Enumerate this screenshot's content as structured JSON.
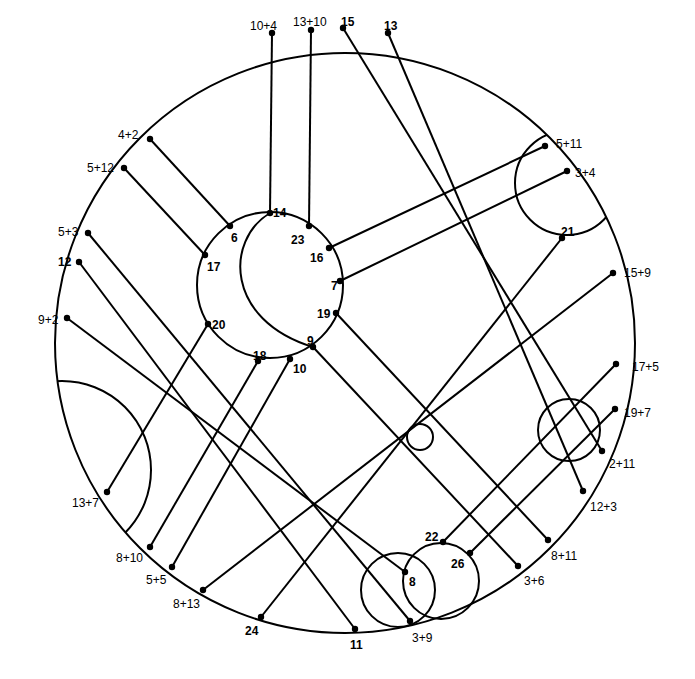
{
  "diagram": {
    "colors": {
      "stroke": "#000000",
      "background": "#ffffff"
    },
    "outer_circle": {
      "cx": 345,
      "cy": 343,
      "r": 290
    },
    "inner_circle": {
      "cx": 270,
      "cy": 285,
      "r": 73
    },
    "crescent_arc": {
      "d": "M 270 213 C 225 240, 225 320, 313 347"
    },
    "circles": [
      {
        "name": "small-center-circle",
        "cx": 420,
        "cy": 437,
        "r": 13
      },
      {
        "name": "lower-right-circle",
        "cx": 569,
        "cy": 430,
        "r": 31
      },
      {
        "name": "bottom-circle-left",
        "cx": 398,
        "cy": 590,
        "r": 37
      },
      {
        "name": "bottom-circle-right",
        "cx": 441,
        "cy": 581,
        "r": 38
      }
    ],
    "clipped_arcs": [
      {
        "name": "upper-right-arc",
        "cx": 567,
        "cy": 183,
        "r": 52
      },
      {
        "name": "left-arc",
        "cx": 62,
        "cy": 470,
        "r": 89
      }
    ],
    "points": [
      {
        "id": "p-10+4",
        "label": "10+4",
        "x": 272,
        "y": 33,
        "lx": 250,
        "ly": 26,
        "bold": false
      },
      {
        "id": "p-13+10",
        "label": "13+10",
        "x": 311,
        "y": 30,
        "lx": 293,
        "ly": 22,
        "bold": false
      },
      {
        "id": "p-15",
        "label": "15",
        "x": 343,
        "y": 28,
        "lx": 341,
        "ly": 22,
        "bold": true
      },
      {
        "id": "p-13",
        "label": "13",
        "x": 388,
        "y": 33,
        "lx": 384,
        "ly": 26,
        "bold": true
      },
      {
        "id": "p-4+2",
        "label": "4+2",
        "x": 150,
        "y": 139,
        "lx": 118,
        "ly": 135,
        "bold": false
      },
      {
        "id": "p-5+12",
        "label": "5+12",
        "x": 124,
        "y": 168,
        "lx": 87,
        "ly": 168,
        "bold": false
      },
      {
        "id": "p-5+3",
        "label": "5+3",
        "x": 88,
        "y": 233,
        "lx": 58,
        "ly": 232,
        "bold": false
      },
      {
        "id": "p-12",
        "label": "12",
        "x": 79,
        "y": 262,
        "lx": 58,
        "ly": 262,
        "bold": true
      },
      {
        "id": "p-9+2",
        "label": "9+2",
        "x": 67,
        "y": 318,
        "lx": 38,
        "ly": 320,
        "bold": false
      },
      {
        "id": "p-13+7",
        "label": "13+7",
        "x": 107,
        "y": 492,
        "lx": 72,
        "ly": 503,
        "bold": false
      },
      {
        "id": "p-8+10",
        "label": "8+10",
        "x": 150,
        "y": 547,
        "lx": 116,
        "ly": 558,
        "bold": false
      },
      {
        "id": "p-5+5",
        "label": "5+5",
        "x": 172,
        "y": 567,
        "lx": 146,
        "ly": 580,
        "bold": false
      },
      {
        "id": "p-8+13",
        "label": "8+13",
        "x": 203,
        "y": 590,
        "lx": 173,
        "ly": 604,
        "bold": false
      },
      {
        "id": "p-24",
        "label": "24",
        "x": 261,
        "y": 617,
        "lx": 245,
        "ly": 631,
        "bold": true
      },
      {
        "id": "p-11",
        "label": "11",
        "x": 355,
        "y": 629,
        "lx": 350,
        "ly": 645,
        "bold": true
      },
      {
        "id": "p-3+9",
        "label": "3+9",
        "x": 410,
        "y": 621,
        "lx": 412,
        "ly": 638,
        "bold": false
      },
      {
        "id": "p-3+6",
        "label": "3+6",
        "x": 518,
        "y": 566,
        "lx": 524,
        "ly": 581,
        "bold": false
      },
      {
        "id": "p-8+11",
        "label": "8+11",
        "x": 548,
        "y": 540,
        "lx": 551,
        "ly": 556,
        "bold": false
      },
      {
        "id": "p-12+3",
        "label": "12+3",
        "x": 583,
        "y": 491,
        "lx": 590,
        "ly": 507,
        "bold": false
      },
      {
        "id": "p-2+11",
        "label": "2+11",
        "x": 602,
        "y": 451,
        "lx": 609,
        "ly": 464,
        "bold": false
      },
      {
        "id": "p-19+7",
        "label": "19+7",
        "x": 615,
        "y": 409,
        "lx": 624,
        "ly": 413,
        "bold": false
      },
      {
        "id": "p-17+5",
        "label": "17+5",
        "x": 616,
        "y": 364,
        "lx": 632,
        "ly": 367,
        "bold": false
      },
      {
        "id": "p-15+9",
        "label": "15+9",
        "x": 613,
        "y": 273,
        "lx": 624,
        "ly": 273,
        "bold": false
      },
      {
        "id": "p-3+4",
        "label": "3+4",
        "x": 567,
        "y": 171,
        "lx": 575,
        "ly": 173,
        "bold": false
      },
      {
        "id": "p-5+11",
        "label": "5+11",
        "x": 545,
        "y": 146,
        "lx": 556,
        "ly": 144,
        "bold": false
      },
      {
        "id": "p-21",
        "label": "21",
        "x": 562,
        "y": 238,
        "lx": 561,
        "ly": 232,
        "bold": true
      },
      {
        "id": "p-22",
        "label": "22",
        "x": 443,
        "y": 542,
        "lx": 425,
        "ly": 537,
        "bold": true
      },
      {
        "id": "p-26",
        "label": "26",
        "x": 470,
        "y": 553,
        "lx": 451,
        "ly": 564,
        "bold": true
      },
      {
        "id": "p-8",
        "label": "8",
        "x": 405,
        "y": 572,
        "lx": 409,
        "ly": 582,
        "bold": true
      },
      {
        "id": "p-14",
        "label": "14",
        "x": 270,
        "y": 213,
        "lx": 273,
        "ly": 213,
        "bold": true
      },
      {
        "id": "p-23",
        "label": "23",
        "x": 309,
        "y": 226,
        "lx": 291,
        "ly": 240,
        "bold": true
      },
      {
        "id": "p-6",
        "label": "6",
        "x": 230,
        "y": 226,
        "lx": 231,
        "ly": 238,
        "bold": true
      },
      {
        "id": "p-17",
        "label": "17",
        "x": 205,
        "y": 255,
        "lx": 207,
        "ly": 267,
        "bold": true
      },
      {
        "id": "p-16",
        "label": "16",
        "x": 329,
        "y": 248,
        "lx": 310,
        "ly": 258,
        "bold": true
      },
      {
        "id": "p-7",
        "label": "7",
        "x": 340,
        "y": 281,
        "lx": 331,
        "ly": 286,
        "bold": true
      },
      {
        "id": "p-19",
        "label": "19",
        "x": 336,
        "y": 313,
        "lx": 317,
        "ly": 314,
        "bold": true
      },
      {
        "id": "p-20",
        "label": "20",
        "x": 208,
        "y": 324,
        "lx": 212,
        "ly": 325,
        "bold": true
      },
      {
        "id": "p-9",
        "label": "9",
        "x": 313,
        "y": 347,
        "lx": 307,
        "ly": 341,
        "bold": true
      },
      {
        "id": "p-18",
        "label": "18",
        "x": 258,
        "y": 361,
        "lx": 253,
        "ly": 356,
        "bold": true
      },
      {
        "id": "p-10",
        "label": "10",
        "x": 290,
        "y": 359,
        "lx": 293,
        "ly": 369,
        "bold": true
      }
    ],
    "lines": [
      {
        "from": "p-10+4",
        "to": "p-14",
        "x1": 272,
        "y1": 33,
        "x2": 270,
        "y2": 213
      },
      {
        "from": "p-13+10",
        "to": "p-23",
        "x1": 311,
        "y1": 30,
        "x2": 309,
        "y2": 226
      },
      {
        "from": "p-15",
        "to": "p-2+11",
        "x1": 343,
        "y1": 28,
        "x2": 602,
        "y2": 451
      },
      {
        "from": "p-13",
        "to": "p-12+3",
        "x1": 388,
        "y1": 33,
        "x2": 583,
        "y2": 491
      },
      {
        "from": "p-4+2",
        "to": "p-6",
        "x1": 150,
        "y1": 139,
        "x2": 230,
        "y2": 226
      },
      {
        "from": "p-5+12",
        "to": "p-17",
        "x1": 124,
        "y1": 168,
        "x2": 205,
        "y2": 255
      },
      {
        "from": "p-5+3",
        "to": "p-3+9",
        "x1": 88,
        "y1": 233,
        "x2": 410,
        "y2": 621
      },
      {
        "from": "p-12",
        "to": "p-11",
        "x1": 79,
        "y1": 262,
        "x2": 355,
        "y2": 629
      },
      {
        "from": "p-9+2",
        "to": "p-8",
        "x1": 67,
        "y1": 318,
        "x2": 405,
        "y2": 572
      },
      {
        "from": "p-5+11",
        "to": "p-16",
        "x1": 545,
        "y1": 146,
        "x2": 329,
        "y2": 248
      },
      {
        "from": "p-3+4",
        "to": "p-7",
        "x1": 567,
        "y1": 171,
        "x2": 340,
        "y2": 281
      },
      {
        "from": "p-21",
        "to": "p-24",
        "x1": 562,
        "y1": 238,
        "x2": 261,
        "y2": 617
      },
      {
        "from": "p-15+9",
        "to": "p-8+13",
        "x1": 613,
        "y1": 273,
        "x2": 203,
        "y2": 590
      },
      {
        "from": "p-17+5",
        "to": "p-22",
        "x1": 616,
        "y1": 364,
        "x2": 443,
        "y2": 542
      },
      {
        "from": "p-19+7",
        "to": "p-26",
        "x1": 615,
        "y1": 409,
        "x2": 470,
        "y2": 553
      },
      {
        "from": "p-19",
        "to": "p-8+11",
        "x1": 336,
        "y1": 313,
        "x2": 548,
        "y2": 540
      },
      {
        "from": "p-9",
        "to": "p-3+6",
        "x1": 313,
        "y1": 347,
        "x2": 518,
        "y2": 566
      },
      {
        "from": "p-20",
        "to": "p-13+7",
        "x1": 208,
        "y1": 324,
        "x2": 107,
        "y2": 492
      },
      {
        "from": "p-18",
        "to": "p-8+10",
        "x1": 258,
        "y1": 361,
        "x2": 150,
        "y2": 547
      },
      {
        "from": "p-10",
        "to": "p-5+5",
        "x1": 290,
        "y1": 359,
        "x2": 172,
        "y2": 567
      }
    ]
  }
}
